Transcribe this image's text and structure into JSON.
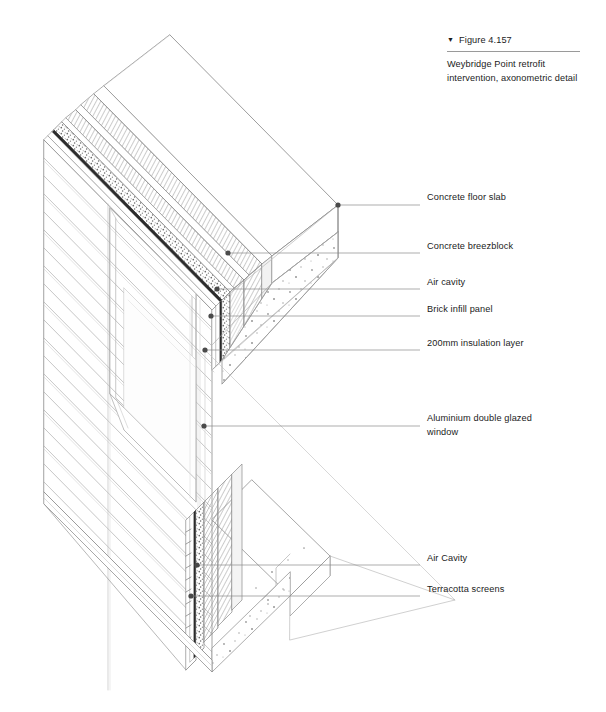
{
  "figure": {
    "marker_icon": "triangle-down-icon",
    "marker_glyph": "▼",
    "number_label": "Figure 4.157",
    "caption": "Weybridge Point retrofit intervention, axonometric detail"
  },
  "drawing": {
    "title": "Weybridge Point retrofit intervention, axonometric detail",
    "type": "axonometric-construction-detail",
    "line_color": "#6e6e6e",
    "leader_color": "#8a8a8a",
    "dot_color": "#4a4a4a",
    "hatch_color": "#8c8c8c",
    "background": "#ffffff"
  },
  "callouts": [
    {
      "id": "concrete-floor-slab",
      "label": "Concrete floor slab",
      "text_x": 427,
      "text_y": 201,
      "dot_x": 338,
      "dot_y": 205,
      "elbow_x": 338
    },
    {
      "id": "concrete-breezblock",
      "label": "Concrete breezblock",
      "text_x": 427,
      "text_y": 250,
      "dot_x": 228,
      "dot_y": 253,
      "elbow_x": 228
    },
    {
      "id": "air-cavity-upper",
      "label": "Air cavity",
      "text_x": 427,
      "text_y": 286,
      "dot_x": 217,
      "dot_y": 289,
      "elbow_x": 217
    },
    {
      "id": "brick-infill-panel",
      "label": "Brick infill panel",
      "text_x": 427,
      "text_y": 313,
      "dot_x": 211,
      "dot_y": 316,
      "elbow_x": 211
    },
    {
      "id": "insulation-layer",
      "label": "200mm insulation layer",
      "text_x": 427,
      "text_y": 347,
      "dot_x": 205,
      "dot_y": 350,
      "elbow_x": 205
    },
    {
      "id": "aluminium-window",
      "label": "Aluminium double glazed\nwindow",
      "text_x": 427,
      "text_y": 422,
      "dot_x": 204,
      "dot_y": 426,
      "elbow_x": 204
    },
    {
      "id": "air-cavity-lower",
      "label": "Air Cavity",
      "text_x": 427,
      "text_y": 562,
      "dot_x": 197,
      "dot_y": 565,
      "elbow_x": 197
    },
    {
      "id": "terracotta-screens",
      "label": "Terracotta screens",
      "text_x": 427,
      "text_y": 593,
      "dot_x": 191,
      "dot_y": 596,
      "elbow_x": 191
    }
  ]
}
